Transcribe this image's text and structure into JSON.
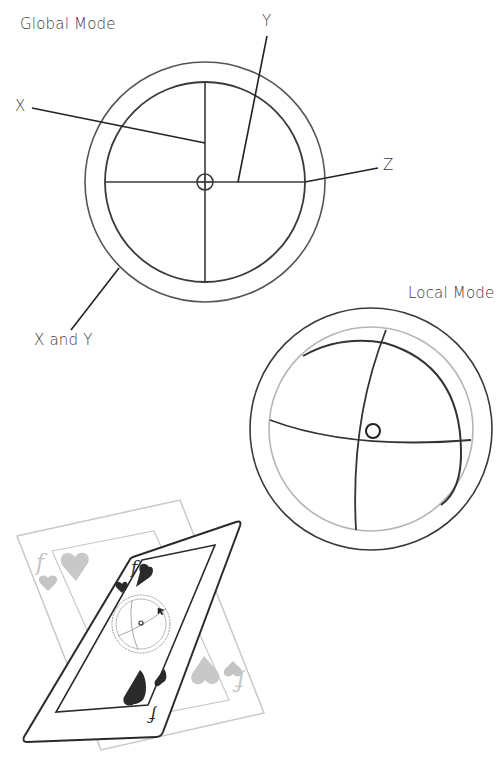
{
  "labels": {
    "global_mode": "Global Mode",
    "local_mode": "Local Mode",
    "x_axis": "X",
    "y_axis": "Y",
    "z_axis": "Z",
    "x_and_y": "X and Y"
  },
  "colors": {
    "ink": "#333333",
    "light_ring": "#b5b5b5",
    "card_dark": "#2c2c2c",
    "card_light": "#c4c4c4"
  },
  "card_glyphs": {
    "rank": "f",
    "suit": "heart"
  }
}
